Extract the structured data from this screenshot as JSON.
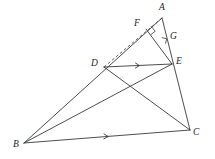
{
  "figure": {
    "background_color": "#ffffff",
    "line_color": "#3a3a3a",
    "label_color": "#1d1d1d",
    "width": 215,
    "height": 159
  },
  "points": {
    "A": {
      "label": "A",
      "x": 162,
      "y": 18,
      "label_x": 159,
      "label_y": 3
    },
    "B": {
      "label": "B",
      "x": 24,
      "y": 143,
      "label_x": 13,
      "label_y": 140
    },
    "C": {
      "label": "C",
      "x": 190,
      "y": 130,
      "label_x": 193,
      "label_y": 128
    },
    "D": {
      "label": "D",
      "x": 104,
      "y": 67,
      "label_x": 91,
      "label_y": 59
    },
    "E": {
      "label": "E",
      "x": 172,
      "y": 64,
      "label_x": 176,
      "label_y": 57
    },
    "F": {
      "label": "F",
      "x": 146,
      "y": 29,
      "label_x": 134,
      "label_y": 19
    },
    "G": {
      "label": "G",
      "x": 165,
      "y": 41,
      "label_x": 170,
      "label_y": 32
    }
  },
  "segments": [
    {
      "name": "side-AB",
      "from": "A",
      "to": "B",
      "style": "solid"
    },
    {
      "name": "side-BC",
      "from": "B",
      "to": "C",
      "style": "solid"
    },
    {
      "name": "side-AC",
      "from": "A",
      "to": "C",
      "style": "solid"
    },
    {
      "name": "segment-DE",
      "from": "D",
      "to": "E",
      "style": "solid"
    },
    {
      "name": "segment-DC",
      "from": "D",
      "to": "C",
      "style": "solid"
    },
    {
      "name": "segment-BE",
      "from": "B",
      "to": "E",
      "style": "solid"
    },
    {
      "name": "segment-EF",
      "from": "E",
      "to": "F",
      "style": "solid"
    },
    {
      "name": "segment-DA-dashed",
      "from": "D",
      "to": "A",
      "style": "dashed"
    }
  ],
  "right_angles": [
    {
      "name": "right-angle-at-F",
      "vertex": "F"
    },
    {
      "name": "right-angle-at-G",
      "vertex": "G"
    }
  ],
  "parallel_marks": [
    {
      "name": "parallel-mark-DE",
      "on": "segment-DE",
      "x": 138,
      "y": 65.5
    },
    {
      "name": "parallel-mark-BC",
      "on": "side-BC",
      "x": 107,
      "y": 136.5
    }
  ],
  "labels_order": [
    "A",
    "B",
    "C",
    "D",
    "E",
    "F",
    "G"
  ]
}
